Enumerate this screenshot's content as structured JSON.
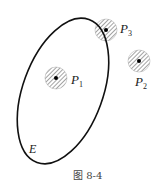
{
  "diagram": {
    "set_label": "E",
    "points": [
      {
        "name": "P",
        "sub": "1",
        "cx": 56,
        "cy": 78,
        "r": 11,
        "position": "interior"
      },
      {
        "name": "P",
        "sub": "2",
        "cx": 139,
        "cy": 61,
        "r": 11,
        "position": "exterior"
      },
      {
        "name": "P",
        "sub": "3",
        "cx": 106,
        "cy": 30,
        "r": 11,
        "position": "boundary"
      }
    ],
    "ellipse": {
      "cx": 63,
      "cy": 91,
      "rx": 40,
      "ry": 76,
      "rotate": 20
    },
    "caption": "图 8-4"
  }
}
